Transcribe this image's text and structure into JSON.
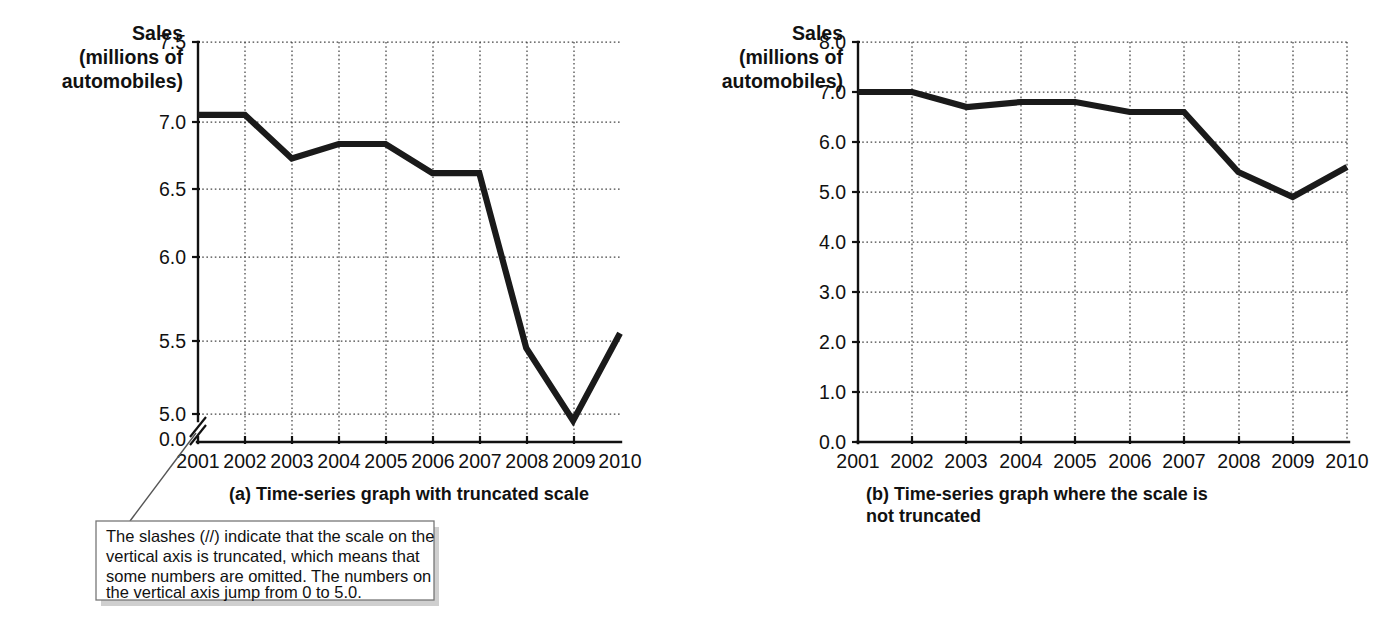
{
  "chart_data": [
    {
      "type": "line",
      "panel": "a",
      "caption": "(a) Time-series graph with truncated scale",
      "title": "",
      "ylabel_lines": [
        "Sales",
        "(millions of",
        "automobiles)"
      ],
      "ylabel": "Sales (millions of automobiles)",
      "xlabel": "",
      "categories": [
        "2001",
        "2002",
        "2003",
        "2004",
        "2005",
        "2006",
        "2007",
        "2008",
        "2009",
        "2010"
      ],
      "x": [
        2001,
        2002,
        2003,
        2004,
        2005,
        2006,
        2007,
        2008,
        2009,
        2010
      ],
      "values": [
        7.0,
        7.0,
        6.7,
        6.8,
        6.8,
        6.6,
        6.6,
        5.4,
        4.9,
        5.5
      ],
      "ytick_labels": [
        "7.5",
        "7.0",
        "6.5",
        "6.0",
        "5.5",
        "5.0",
        "0.0"
      ],
      "ytick_values": [
        7.5,
        7.0,
        6.5,
        6.0,
        5.5,
        5.0,
        0.0
      ],
      "ylim": [
        4.85,
        7.5
      ],
      "axis_truncated": true,
      "truncation_note": "Scale truncated between 0.0 and 5.0",
      "grid": true,
      "legend": "none"
    },
    {
      "type": "line",
      "panel": "b",
      "caption": "(b) Time-series graph where the scale is not truncated",
      "caption_lines": [
        "(b) Time-series graph where the scale is",
        "not truncated"
      ],
      "title": "",
      "ylabel_lines": [
        "Sales",
        "(millions of",
        "automobiles)"
      ],
      "ylabel": "Sales (millions of automobiles)",
      "xlabel": "",
      "categories": [
        "2001",
        "2002",
        "2003",
        "2004",
        "2005",
        "2006",
        "2007",
        "2008",
        "2009",
        "2010"
      ],
      "x": [
        2001,
        2002,
        2003,
        2004,
        2005,
        2006,
        2007,
        2008,
        2009,
        2010
      ],
      "values": [
        7.0,
        7.0,
        6.7,
        6.8,
        6.8,
        6.6,
        6.6,
        5.4,
        4.9,
        5.5
      ],
      "ytick_labels": [
        "8.0",
        "7.0",
        "6.0",
        "5.0",
        "4.0",
        "3.0",
        "2.0",
        "1.0",
        "0.0"
      ],
      "ytick_values": [
        8.0,
        7.0,
        6.0,
        5.0,
        4.0,
        3.0,
        2.0,
        1.0,
        0.0
      ],
      "ylim": [
        0.0,
        8.0
      ],
      "axis_truncated": false,
      "grid": true,
      "legend": "none"
    }
  ],
  "callout": {
    "lines": [
      "The slashes (//) indicate that the scale on the",
      "vertical axis is truncated, which means that",
      "some numbers are omitted.  The numbers on",
      "the vertical axis jump from 0 to 5.0."
    ],
    "text": "The slashes (//) indicate that the scale on the vertical axis is truncated, which means that some numbers are omitted. The numbers on the vertical axis jump from 0 to 5.0."
  },
  "colors": {
    "data_line": "#1a1a1a",
    "axis": "#111111",
    "grid": "#444444",
    "callout_border": "#777777",
    "callout_shadow": "#cfcfcf",
    "background": "#ffffff"
  }
}
